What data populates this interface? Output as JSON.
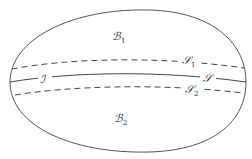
{
  "diagram": {
    "regions": [
      {
        "id": "B1",
        "symbol": "ℬ",
        "subscript": "1",
        "description": "upper region"
      },
      {
        "id": "B2",
        "symbol": "ℬ",
        "subscript": "2",
        "description": "lower region"
      }
    ],
    "curves": [
      {
        "id": "S1",
        "symbol": "𝒮",
        "subscript": "1",
        "style": "dashed"
      },
      {
        "id": "S",
        "symbol": "𝒮",
        "subscript": "",
        "style": "solid"
      },
      {
        "id": "S2",
        "symbol": "𝒮",
        "subscript": "2",
        "style": "dashed"
      }
    ],
    "markers": [
      {
        "id": "I",
        "symbol": "ℐ"
      }
    ],
    "colors": {
      "stroke": "#444444",
      "text": "#333333",
      "background": "#ffffff"
    }
  }
}
